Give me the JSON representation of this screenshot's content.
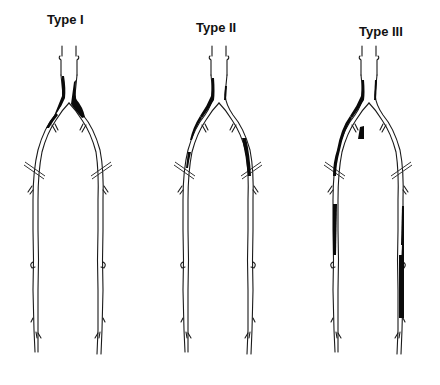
{
  "diagram": {
    "type": "anatomical-illustration",
    "panels": [
      {
        "id": "type1",
        "title": "Type I",
        "title_x": 27,
        "title_y": 12,
        "offset_x": 0,
        "description": "Disease confined to distal aorta and common iliac arteries"
      },
      {
        "id": "type2",
        "title": "Type II",
        "title_x": 168,
        "title_y": 20,
        "offset_x": 148,
        "description": "Disease in aorto-iliac segment extending into external iliac arteries"
      },
      {
        "id": "type3",
        "title": "Type III",
        "title_x": 360,
        "title_y": 24,
        "offset_x": 296,
        "description": "Multilevel disease including femoral-popliteal segments"
      }
    ]
  }
}
